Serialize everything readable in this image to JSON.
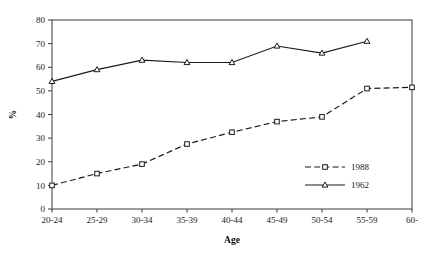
{
  "chart_data": {
    "type": "line",
    "title": "",
    "xlabel": "Age",
    "ylabel": "%",
    "categories": [
      "20-24",
      "25-29",
      "30-34",
      "35-39",
      "40-44",
      "45-49",
      "50-54",
      "55-59",
      "60-"
    ],
    "ylim": [
      0,
      80
    ],
    "ytick_step": 10,
    "yticks": [
      0,
      10,
      20,
      30,
      40,
      50,
      60,
      70,
      80
    ],
    "grid": false,
    "legend_position": "inside-right-lower",
    "series": [
      {
        "name": "1988",
        "values": [
          10,
          15,
          19,
          27.5,
          32.5,
          37,
          39,
          51,
          51.5
        ],
        "line_style": "dashed",
        "marker": "square",
        "color": "#1a1a1a"
      },
      {
        "name": "1962",
        "values": [
          54,
          59,
          63,
          62,
          62,
          69,
          66,
          71,
          null
        ],
        "line_style": "solid",
        "marker": "triangle",
        "color": "#1a1a1a"
      }
    ]
  },
  "legend": {
    "entries": [
      {
        "label": "1988"
      },
      {
        "label": "1962"
      }
    ]
  },
  "axes": {
    "x_title": "Age",
    "y_title": "%"
  }
}
